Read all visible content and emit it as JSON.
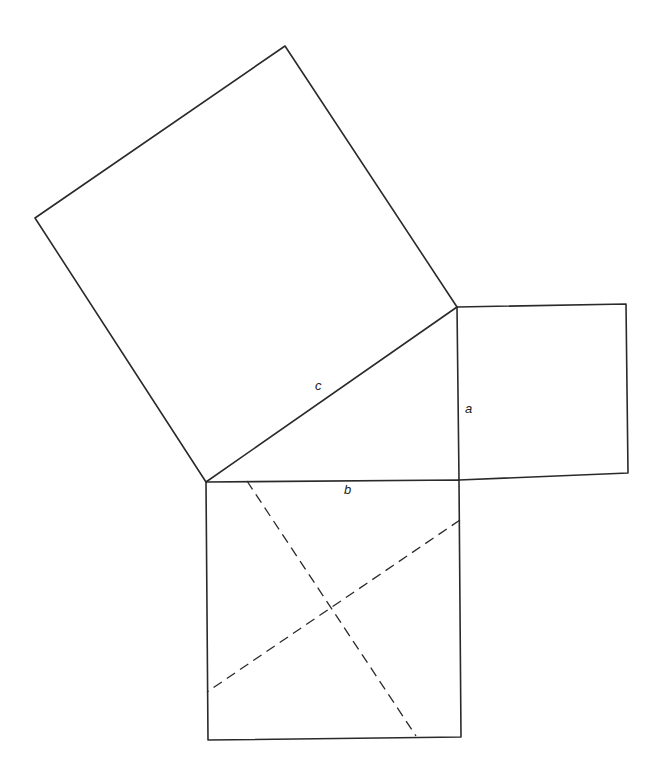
{
  "diagram": {
    "title": "",
    "labels": {
      "a": "a",
      "b": "b",
      "c": "c"
    },
    "triangle": {
      "vertices": [
        [
          206,
          482
        ],
        [
          457,
          307
        ],
        [
          459,
          480
        ]
      ],
      "right_angle_at": [
        459,
        480
      ]
    },
    "squares": {
      "on_c": [
        [
          206,
          482
        ],
        [
          35,
          218
        ],
        [
          285,
          46
        ],
        [
          457,
          307
        ]
      ],
      "on_a": [
        [
          457,
          307
        ],
        [
          626,
          304
        ],
        [
          628,
          473
        ],
        [
          459,
          480
        ]
      ],
      "on_b": [
        [
          206,
          482
        ],
        [
          459,
          480
        ],
        [
          461,
          737
        ],
        [
          208,
          740
        ]
      ]
    },
    "dashed_lines": [
      [
        [
          247,
          481
        ],
        [
          416,
          736
        ]
      ],
      [
        [
          460,
          520
        ],
        [
          207,
          692
        ]
      ]
    ],
    "colors": {
      "stroke": "#2a2a2a",
      "background": "#ffffff"
    }
  }
}
